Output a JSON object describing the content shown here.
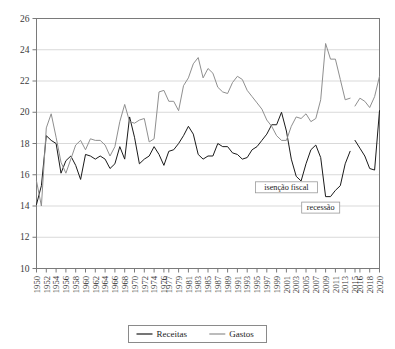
{
  "chart_data": {
    "type": "line",
    "title": "",
    "subtitle": "",
    "xlabel": "",
    "ylabel": "",
    "ylim": [
      10,
      26
    ],
    "ytick_values": [
      10,
      12,
      14,
      16,
      18,
      20,
      22,
      24,
      26
    ],
    "ytick_labels": [
      "10",
      "12",
      "14",
      "16",
      "18",
      "20",
      "22",
      "24",
      "26"
    ],
    "grid": true,
    "grid_axis": "y",
    "legend_position": "bottom",
    "xlim": [
      1950,
      2020
    ],
    "xtick_labels": [
      "1950",
      "1952",
      "1954",
      "1956",
      "1958",
      "1960",
      "1962",
      "1964",
      "1966",
      "1968",
      "1970",
      "1972",
      "1974",
      "1976",
      "1977",
      "1979",
      "1981",
      "1983",
      "1985",
      "1987",
      "1989",
      "1991",
      "1993",
      "1995",
      "1997",
      "1999",
      "2001",
      "2003",
      "2005",
      "2007",
      "2009",
      "2011",
      "2013",
      "2015",
      "2016",
      "2018",
      "2020"
    ],
    "xtick_years": [
      1950,
      1952,
      1954,
      1956,
      1958,
      1960,
      1962,
      1964,
      1966,
      1968,
      1970,
      1972,
      1974,
      1976,
      1977,
      1979,
      1981,
      1983,
      1985,
      1987,
      1989,
      1991,
      1993,
      1995,
      1997,
      1999,
      2001,
      2003,
      2005,
      2007,
      2009,
      2011,
      2013,
      2015,
      2016,
      2018,
      2020
    ],
    "x": [
      1950,
      1951,
      1952,
      1953,
      1954,
      1955,
      1956,
      1957,
      1958,
      1959,
      1960,
      1961,
      1962,
      1963,
      1964,
      1965,
      1966,
      1967,
      1968,
      1969,
      1970,
      1971,
      1972,
      1973,
      1974,
      1975,
      1976,
      1977,
      1978,
      1979,
      1980,
      1981,
      1982,
      1983,
      1984,
      1985,
      1986,
      1987,
      1988,
      1989,
      1990,
      1991,
      1992,
      1993,
      1994,
      1995,
      1996,
      1997,
      1998,
      1999,
      2000,
      2001,
      2002,
      2003,
      2004,
      2005,
      2006,
      2007,
      2008,
      2009,
      2010,
      2011,
      2012,
      2013,
      2014,
      2015,
      2016,
      2017,
      2018,
      2019,
      2020
    ],
    "series": [
      {
        "name": "Receitas",
        "color": "#1a1a1a",
        "values": [
          14.1,
          15.3,
          18.5,
          18.2,
          18.0,
          16.1,
          16.9,
          17.2,
          16.6,
          15.7,
          17.3,
          17.2,
          17.0,
          17.2,
          17.0,
          16.4,
          16.7,
          17.8,
          17.0,
          19.7,
          18.4,
          16.7,
          17.0,
          17.2,
          17.8,
          17.3,
          16.6,
          17.5,
          17.6,
          18.0,
          18.5,
          19.1,
          18.6,
          17.3,
          17.0,
          17.2,
          17.2,
          18.0,
          17.8,
          17.8,
          17.4,
          17.3,
          17.0,
          17.1,
          17.6,
          17.8,
          18.2,
          18.6,
          19.2,
          19.2,
          20.0,
          18.8,
          17.0,
          15.9,
          15.6,
          16.7,
          17.6,
          17.9,
          17.1,
          14.6,
          14.6,
          15.0,
          15.3,
          16.7,
          17.5,
          18.2,
          17.7,
          17.2,
          16.4,
          16.3,
          20.1
        ]
      },
      {
        "name": "Gastos",
        "color": "#8f8f8f",
        "values": [
          15.6,
          14.0,
          19.0,
          19.9,
          18.4,
          16.8,
          16.1,
          17.0,
          17.9,
          18.2,
          17.6,
          18.3,
          18.2,
          18.2,
          17.9,
          17.2,
          17.8,
          19.4,
          20.5,
          19.4,
          19.3,
          19.5,
          19.6,
          18.1,
          18.3,
          21.3,
          21.4,
          20.7,
          20.7,
          20.1,
          21.7,
          22.2,
          23.1,
          23.5,
          22.2,
          22.8,
          22.5,
          21.6,
          21.3,
          21.2,
          21.9,
          22.3,
          22.1,
          21.4,
          21.0,
          20.6,
          20.2,
          19.5,
          19.1,
          18.5,
          18.2,
          18.2,
          19.1,
          19.7,
          19.6,
          19.9,
          19.4,
          19.6,
          20.8,
          24.4,
          23.4,
          23.4,
          22.1,
          20.8,
          20.9,
          20.4,
          20.9,
          20.7,
          20.3,
          21.0,
          22.3
        ]
      }
    ],
    "annotations": [
      {
        "label": "isenção fiscal",
        "x_year": 2001,
        "y_value": 15.2
      },
      {
        "label": "recessão",
        "x_year": 2008,
        "y_value": 13.9
      }
    ],
    "legend": [
      {
        "label": "Receitas",
        "color": "#1a1a1a"
      },
      {
        "label": "Gastos",
        "color": "#8f8f8f"
      }
    ]
  }
}
